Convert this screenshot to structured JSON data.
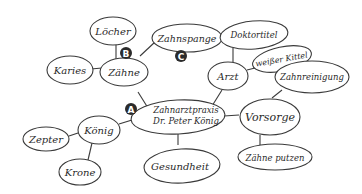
{
  "diagram": {
    "type": "mind-map",
    "center": {
      "label_line1": "Zahnarztpraxis",
      "label_line2": "Dr. Peter König",
      "marker": "A"
    },
    "nodes": {
      "zaehne": "Zähne",
      "loecher": "Löcher",
      "karies": "Karies",
      "zahnspange": "Zahnspange",
      "arzt": "Arzt",
      "doktortitel": "Doktortitel",
      "weisser_kittel": "weißer Kittel",
      "zahnreinigung": "Zahnreinigung",
      "vorsorge": "Vorsorge",
      "zaehne_putzen": "Zähne putzen",
      "koenig": "König",
      "zepter": "Zepter",
      "krone": "Krone",
      "gesundheit": "Gesundheit"
    },
    "markers": {
      "b": "B",
      "c": "C"
    },
    "colors": {
      "stroke": "#3a3a3a",
      "marker_fill": "#2b2b2b",
      "background": "#ffffff"
    }
  }
}
